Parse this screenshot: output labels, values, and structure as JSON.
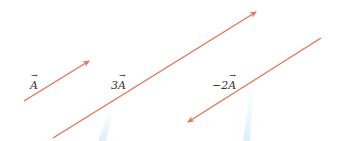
{
  "diagram": {
    "colors": {
      "arrow": "#e8735a",
      "streak": "#d6eef7",
      "text": "#333333"
    },
    "vectors": [
      {
        "id": "A",
        "prefix": "",
        "symbol": "A",
        "x1": 24,
        "y1": 101,
        "x2": 89,
        "y2": 61
      },
      {
        "id": "3A",
        "prefix": "3",
        "symbol": "A",
        "x1": 53,
        "y1": 138,
        "x2": 256,
        "y2": 12
      },
      {
        "id": "-2A",
        "prefix": "−2",
        "symbol": "A",
        "x1": 321,
        "y1": 38,
        "x2": 188,
        "y2": 122
      }
    ],
    "labels": {
      "A": {
        "prefix": "",
        "symbol": "A"
      },
      "3A": {
        "prefix": "3",
        "symbol": "A"
      },
      "neg2A": {
        "prefix": "−2",
        "symbol": "A"
      }
    }
  }
}
